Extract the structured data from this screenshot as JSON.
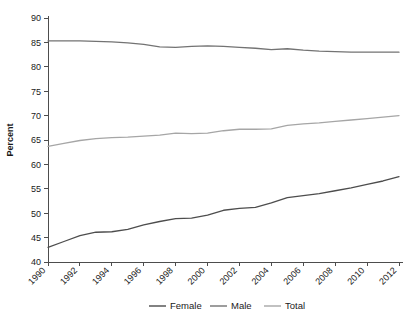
{
  "chart_data": {
    "type": "line",
    "title": "",
    "xlabel": "",
    "ylabel": "Percent",
    "xlim": [
      1990,
      2012
    ],
    "ylim": [
      40,
      90
    ],
    "ytick_step": 5,
    "xtick_step": 2,
    "grid": false,
    "legend_position": "bottom",
    "x": [
      1990,
      1991,
      1992,
      1993,
      1994,
      1995,
      1996,
      1997,
      1998,
      1999,
      2000,
      2001,
      2002,
      2003,
      2004,
      2005,
      2006,
      2007,
      2008,
      2009,
      2010,
      2011,
      2012
    ],
    "yticks": [
      40,
      45,
      50,
      55,
      60,
      65,
      70,
      75,
      80,
      85,
      90
    ],
    "xticks": [
      1990,
      1992,
      1994,
      1996,
      1998,
      2000,
      2002,
      2004,
      2006,
      2008,
      2010,
      2012
    ],
    "series": [
      {
        "name": "Female",
        "color": "#4d4d4d",
        "values": [
          43.0,
          44.2,
          45.4,
          46.1,
          46.2,
          46.7,
          47.6,
          48.3,
          48.9,
          49.0,
          49.6,
          50.6,
          51.0,
          51.2,
          52.1,
          53.2,
          53.6,
          54.0,
          54.6,
          55.2,
          55.9,
          56.6,
          57.5
        ]
      },
      {
        "name": "Male",
        "color": "#737373",
        "values": [
          85.3,
          85.3,
          85.3,
          85.2,
          85.1,
          84.9,
          84.6,
          84.1,
          84.0,
          84.2,
          84.3,
          84.2,
          84.0,
          83.8,
          83.5,
          83.7,
          83.4,
          83.2,
          83.1,
          83.0,
          83.0,
          83.0,
          83.0
        ]
      },
      {
        "name": "Total",
        "color": "#a6a6a6",
        "values": [
          63.7,
          64.3,
          64.9,
          65.3,
          65.5,
          65.6,
          65.8,
          66.0,
          66.4,
          66.3,
          66.4,
          66.9,
          67.2,
          67.2,
          67.3,
          68.0,
          68.3,
          68.5,
          68.8,
          69.1,
          69.4,
          69.7,
          70.0
        ]
      }
    ],
    "legend": [
      {
        "label": "Female",
        "color": "#4d4d4d"
      },
      {
        "label": "Male",
        "color": "#737373"
      },
      {
        "label": "Total",
        "color": "#a6a6a6"
      }
    ]
  }
}
